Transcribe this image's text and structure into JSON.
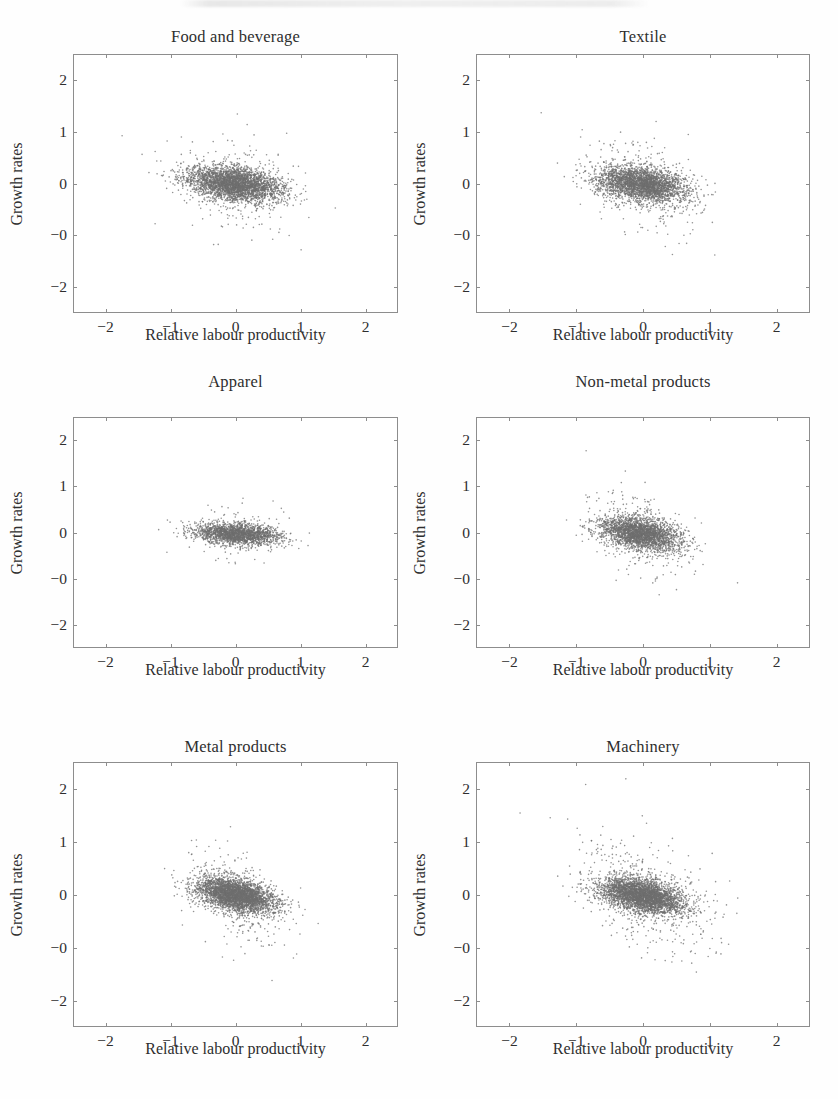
{
  "figure": {
    "panel_order": [
      "food_beverage",
      "textile",
      "apparel",
      "non_metal",
      "metal",
      "machinery"
    ]
  },
  "axis": {
    "xlabel": "Relative labour productivity",
    "ylabel": "Growth rates",
    "xticks": [
      "−2",
      "−1",
      "0",
      "1",
      "2"
    ],
    "xtick_values": [
      -2,
      -1,
      0,
      1,
      2
    ],
    "yticks": [
      "2",
      "1",
      "0",
      "−0",
      "−2"
    ],
    "ytick_values": [
      2,
      1,
      0,
      -1,
      -2
    ],
    "xlim": [
      -2.5,
      2.5
    ],
    "ylim": [
      -2.5,
      2.5
    ],
    "grid": false,
    "point_color": "#6f6f6f",
    "frame_color": "#8d8d8d"
  },
  "chart_data": [
    {
      "type": "scatter",
      "id": "food_beverage",
      "title": "Food and beverage",
      "xlabel": "Relative labour productivity",
      "ylabel": "Growth rates",
      "xlim": [
        -2.5,
        2.5
      ],
      "ylim": [
        -2.5,
        2.5
      ],
      "xticks": [
        -2,
        -1,
        0,
        1,
        2
      ],
      "yticks": [
        2,
        1,
        0,
        -1,
        -2
      ],
      "ytick_labels": [
        "2",
        "1",
        "0",
        "−0",
        "−2"
      ],
      "grid": false,
      "legend": null,
      "n_points": 3400,
      "marker_color": "#6f6f6f",
      "marker_size_px": 1.6,
      "cluster": {
        "center_x": -0.02,
        "center_y": 0.0,
        "sd_x": 0.36,
        "sd_y": 0.165,
        "correlation": -0.33,
        "outlier_fraction": 0.085,
        "outlier_spread": 2.3
      },
      "description": "Dense elongated cloud centred near the origin with a mild negative tilt; scattered outliers reach x ≈ ±2.3 and y ≈ ±2.2."
    },
    {
      "type": "scatter",
      "id": "textile",
      "title": "Textile",
      "xlabel": "Relative labour productivity",
      "ylabel": "Growth rates",
      "xlim": [
        -2.5,
        2.5
      ],
      "ylim": [
        -2.5,
        2.5
      ],
      "xticks": [
        -2,
        -1,
        0,
        1,
        2
      ],
      "yticks": [
        2,
        1,
        0,
        -1,
        -2
      ],
      "ytick_labels": [
        "2",
        "1",
        "0",
        "−0",
        "−2"
      ],
      "grid": false,
      "legend": null,
      "n_points": 3100,
      "marker_color": "#6f6f6f",
      "marker_size_px": 1.6,
      "cluster": {
        "center_x": -0.03,
        "center_y": 0.0,
        "sd_x": 0.33,
        "sd_y": 0.17,
        "correlation": -0.3,
        "outlier_fraction": 0.1,
        "outlier_spread": 2.2
      },
      "description": "Compact negatively tilted cloud; upper-left outliers extend past y = 2 and a few points sit near x = −2.2."
    },
    {
      "type": "scatter",
      "id": "apparel",
      "title": "Apparel",
      "xlabel": "Relative labour productivity",
      "ylabel": "Growth rates",
      "xlim": [
        -2.5,
        2.5
      ],
      "ylim": [
        -2.5,
        2.5
      ],
      "xticks": [
        -2,
        -1,
        0,
        1,
        2
      ],
      "yticks": [
        2,
        1,
        0,
        -1,
        -2
      ],
      "ytick_labels": [
        "2",
        "1",
        "0",
        "−0",
        "−2"
      ],
      "grid": false,
      "legend": null,
      "n_points": 2100,
      "marker_color": "#6f6f6f",
      "marker_size_px": 1.6,
      "cluster": {
        "center_x": 0.0,
        "center_y": -0.01,
        "sd_x": 0.32,
        "sd_y": 0.115,
        "correlation": -0.22,
        "outlier_fraction": 0.07,
        "outlier_spread": 1.9
      },
      "description": "Tightest and flattest of the six clouds; the horizontal band spans roughly x = −1.2 to 2.0 with very little vertical spread."
    },
    {
      "type": "scatter",
      "id": "non_metal",
      "title": "Non-metal products",
      "xlabel": "Relative labour productivity",
      "ylabel": "Growth rates",
      "xlim": [
        -2.5,
        2.5
      ],
      "ylim": [
        -2.5,
        2.5
      ],
      "xticks": [
        -2,
        -1,
        0,
        1,
        2
      ],
      "yticks": [
        2,
        1,
        0,
        -1,
        -2
      ],
      "ytick_labels": [
        "2",
        "1",
        "0",
        "−0",
        "−2"
      ],
      "grid": false,
      "legend": null,
      "n_points": 2800,
      "marker_color": "#6f6f6f",
      "marker_size_px": 1.6,
      "cluster": {
        "center_x": -0.05,
        "center_y": 0.0,
        "sd_x": 0.3,
        "sd_y": 0.175,
        "correlation": -0.38,
        "outlier_fraction": 0.12,
        "outlier_spread": 2.0
      },
      "description": "Moderately tilted cloud with a broad halo; stragglers fall to y ≈ −2 around x = −1 and x = 0."
    },
    {
      "type": "scatter",
      "id": "metal",
      "title": "Metal products",
      "xlabel": "Relative labour productivity",
      "ylabel": "Growth rates",
      "xlim": [
        -2.5,
        2.5
      ],
      "ylim": [
        -2.5,
        2.5
      ],
      "xticks": [
        -2,
        -1,
        0,
        1,
        2
      ],
      "yticks": [
        2,
        1,
        0,
        -1,
        -2
      ],
      "ytick_labels": [
        "2",
        "1",
        "0",
        "−0",
        "−2"
      ],
      "grid": false,
      "legend": null,
      "n_points": 3600,
      "marker_color": "#6f6f6f",
      "marker_size_px": 1.6,
      "cluster": {
        "center_x": 0.0,
        "center_y": 0.0,
        "sd_x": 0.3,
        "sd_y": 0.165,
        "correlation": -0.42,
        "outlier_fraction": 0.09,
        "outlier_spread": 2.1
      },
      "description": "Dark dense core between x = −0.7 and 0.8 with a clear downward slope; sparse tail of outliers toward the lower right."
    },
    {
      "type": "scatter",
      "id": "machinery",
      "title": "Machinery",
      "xlabel": "Relative labour productivity",
      "ylabel": "Growth rates",
      "xlim": [
        -2.5,
        2.5
      ],
      "ylim": [
        -2.5,
        2.5
      ],
      "xticks": [
        -2,
        -1,
        0,
        1,
        2
      ],
      "yticks": [
        2,
        1,
        0,
        -1,
        -2
      ],
      "ytick_labels": [
        "2",
        "1",
        "0",
        "−0",
        "−2"
      ],
      "grid": false,
      "legend": null,
      "n_points": 3800,
      "marker_color": "#6f6f6f",
      "marker_size_px": 1.6,
      "cluster": {
        "center_x": -0.02,
        "center_y": 0.0,
        "sd_x": 0.32,
        "sd_y": 0.17,
        "correlation": -0.45,
        "outlier_fraction": 0.13,
        "outlier_spread": 2.4
      },
      "description": "Strongest negative tilt and widest halo; outliers reach the upper-left corner near (−2.4, 2.3) and the lower right near (1.6, −2)."
    }
  ]
}
